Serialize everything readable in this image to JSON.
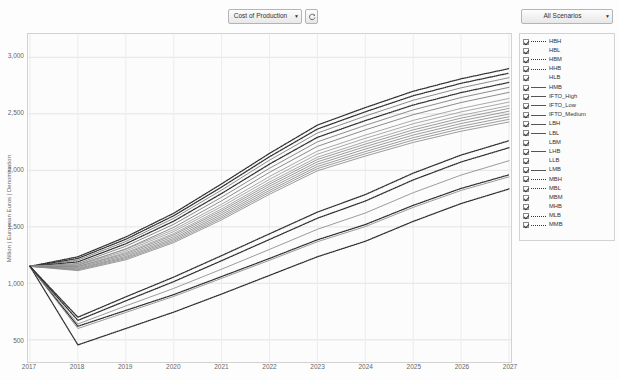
{
  "toolbar": {
    "metric_select": {
      "value": "Cost of Production",
      "arrow": "▼"
    },
    "refresh_button": {
      "name": "refresh-icon"
    },
    "scenario_select": {
      "value": "All Scenarios",
      "arrow": "▼"
    }
  },
  "chart_data": {
    "type": "line",
    "title": "",
    "xlabel": "",
    "ylabel": "Million | European Euros | Denomination",
    "x": [
      2017,
      2018,
      2019,
      2020,
      2021,
      2022,
      2023,
      2024,
      2025,
      2026,
      2027
    ],
    "xtick_labels": [
      "2017",
      "2018",
      "2019",
      "2020",
      "2021",
      "2022",
      "2023",
      "2024",
      "2025",
      "2026",
      "2027"
    ],
    "ytick_labels": [
      "500",
      "1,000",
      "1,500",
      "2,000",
      "2,500",
      "3,000"
    ],
    "yticks": [
      500,
      1000,
      1500,
      2000,
      2500,
      3000
    ],
    "ylim": [
      330,
      3180
    ],
    "xlim": [
      2017,
      2027
    ],
    "grid": true,
    "legend_position": "right-outside",
    "series": [
      {
        "name": "HBH",
        "style": "dotted",
        "color": "#333333",
        "values": [
          1150,
          1235,
          1410,
          1620,
          1880,
          2150,
          2400,
          2555,
          2700,
          2810,
          2900
        ]
      },
      {
        "name": "HBL",
        "style": "solid",
        "color": "#777777",
        "values": [
          1150,
          1205,
          1370,
          1575,
          1825,
          2090,
          2330,
          2480,
          2620,
          2730,
          2820
        ]
      },
      {
        "name": "HBM",
        "style": "dotted",
        "color": "#333333",
        "values": [
          1150,
          1220,
          1390,
          1598,
          1852,
          2120,
          2365,
          2518,
          2660,
          2770,
          2860
        ]
      },
      {
        "name": "HHB",
        "style": "dotted",
        "color": "#333333",
        "values": [
          1150,
          1190,
          1350,
          1550,
          1795,
          2055,
          2292,
          2440,
          2578,
          2688,
          2778
        ]
      },
      {
        "name": "HLB",
        "style": "solid",
        "color": "#777777",
        "values": [
          1150,
          1160,
          1305,
          1495,
          1730,
          1982,
          2212,
          2358,
          2492,
          2600,
          2690
        ]
      },
      {
        "name": "HMB",
        "style": "solid",
        "color": "#777777",
        "values": [
          1150,
          1175,
          1328,
          1522,
          1762,
          2018,
          2252,
          2398,
          2535,
          2644,
          2734
        ]
      },
      {
        "name": "IFTO_High",
        "style": "solid",
        "color": "#9a9a9a",
        "values": [
          1150,
          1168,
          1300,
          1475,
          1700,
          1945,
          2170,
          2312,
          2442,
          2548,
          2636
        ]
      },
      {
        "name": "IFTO_Low",
        "style": "solid",
        "color": "#9a9a9a",
        "values": [
          1150,
          1150,
          1272,
          1440,
          1658,
          1896,
          2116,
          2254,
          2382,
          2486,
          2572
        ]
      },
      {
        "name": "IFTO_Medium",
        "style": "solid",
        "color": "#9a9a9a",
        "values": [
          1150,
          1159,
          1286,
          1458,
          1679,
          1920,
          2143,
          2283,
          2412,
          2517,
          2604
        ]
      },
      {
        "name": "LBH",
        "style": "solid",
        "color": "#8a8a8a",
        "values": [
          1150,
          1148,
          1262,
          1428,
          1642,
          1878,
          2096,
          2232,
          2358,
          2462,
          2548
        ]
      },
      {
        "name": "LBL",
        "style": "solid",
        "color": "#8a8a8a",
        "values": [
          1150,
          1132,
          1238,
          1398,
          1608,
          1840,
          2054,
          2188,
          2312,
          2414,
          2498
        ]
      },
      {
        "name": "LBM",
        "style": "solid",
        "color": "#8a8a8a",
        "values": [
          1150,
          1140,
          1250,
          1413,
          1625,
          1859,
          2075,
          2210,
          2335,
          2438,
          2523
        ]
      },
      {
        "name": "LHB",
        "style": "solid",
        "color": "#8a8a8a",
        "values": [
          1150,
          1126,
          1228,
          1385,
          1592,
          1822,
          2034,
          2166,
          2289,
          2390,
          2474
        ]
      },
      {
        "name": "LLB",
        "style": "solid",
        "color": "#8a8a8a",
        "values": [
          1150,
          1112,
          1208,
          1360,
          1562,
          1788,
          1996,
          2126,
          2247,
          2346,
          2428
        ]
      },
      {
        "name": "LMB",
        "style": "solid",
        "color": "#8a8a8a",
        "values": [
          1150,
          1119,
          1218,
          1372,
          1577,
          1805,
          2015,
          2146,
          2268,
          2368,
          2451
        ]
      },
      {
        "name": "MBH",
        "style": "dotted",
        "color": "#333333",
        "values": [
          1150,
          620,
          760,
          900,
          1060,
          1220,
          1385,
          1520,
          1690,
          1840,
          1960
        ]
      },
      {
        "name": "MBL",
        "style": "dotted",
        "color": "#333333",
        "values": [
          1150,
          455,
          600,
          745,
          905,
          1070,
          1235,
          1372,
          1548,
          1706,
          1835
        ]
      },
      {
        "name": "MBM",
        "style": "solid",
        "color": "#8a8a8a",
        "values": [
          1150,
          600,
          742,
          884,
          1044,
          1204,
          1368,
          1502,
          1672,
          1822,
          1942
        ]
      },
      {
        "name": "MHB",
        "style": "solid",
        "color": "#8a8a8a",
        "values": [
          1150,
          640,
          800,
          955,
          1125,
          1300,
          1478,
          1622,
          1802,
          1958,
          2085
        ]
      },
      {
        "name": "MLB",
        "style": "dotted",
        "color": "#333333",
        "values": [
          1150,
          700,
          880,
          1055,
          1245,
          1438,
          1630,
          1785,
          1975,
          2135,
          2262
        ]
      },
      {
        "name": "MMB",
        "style": "dotted",
        "color": "#333333",
        "values": [
          1150,
          672,
          845,
          1015,
          1200,
          1388,
          1576,
          1728,
          1915,
          2074,
          2200
        ]
      }
    ]
  },
  "legend": {
    "items": [
      {
        "label": "HBH",
        "style": "dotted",
        "checked": true
      },
      {
        "label": "HBL",
        "style": "none",
        "checked": true
      },
      {
        "label": "HBM",
        "style": "dotted",
        "checked": true
      },
      {
        "label": "HHB",
        "style": "dotted",
        "checked": true
      },
      {
        "label": "HLB",
        "style": "none",
        "checked": true
      },
      {
        "label": "HMB",
        "style": "solid",
        "checked": true
      },
      {
        "label": "IFTO_High",
        "style": "solid",
        "checked": true
      },
      {
        "label": "IFTO_Low",
        "style": "solid",
        "checked": true
      },
      {
        "label": "IFTO_Medium",
        "style": "solid",
        "checked": true
      },
      {
        "label": "LBH",
        "style": "solid",
        "checked": true
      },
      {
        "label": "LBL",
        "style": "solid",
        "checked": true
      },
      {
        "label": "LBM",
        "style": "none",
        "checked": true
      },
      {
        "label": "LHB",
        "style": "solid",
        "checked": true
      },
      {
        "label": "LLB",
        "style": "none",
        "checked": true
      },
      {
        "label": "LMB",
        "style": "solid",
        "checked": true
      },
      {
        "label": "MBH",
        "style": "dotted",
        "checked": true
      },
      {
        "label": "MBL",
        "style": "dotted",
        "checked": true
      },
      {
        "label": "MBM",
        "style": "none",
        "checked": true
      },
      {
        "label": "MHB",
        "style": "none",
        "checked": true
      },
      {
        "label": "MLB",
        "style": "dotted",
        "checked": true
      },
      {
        "label": "MMB",
        "style": "dotted",
        "checked": true
      }
    ]
  }
}
